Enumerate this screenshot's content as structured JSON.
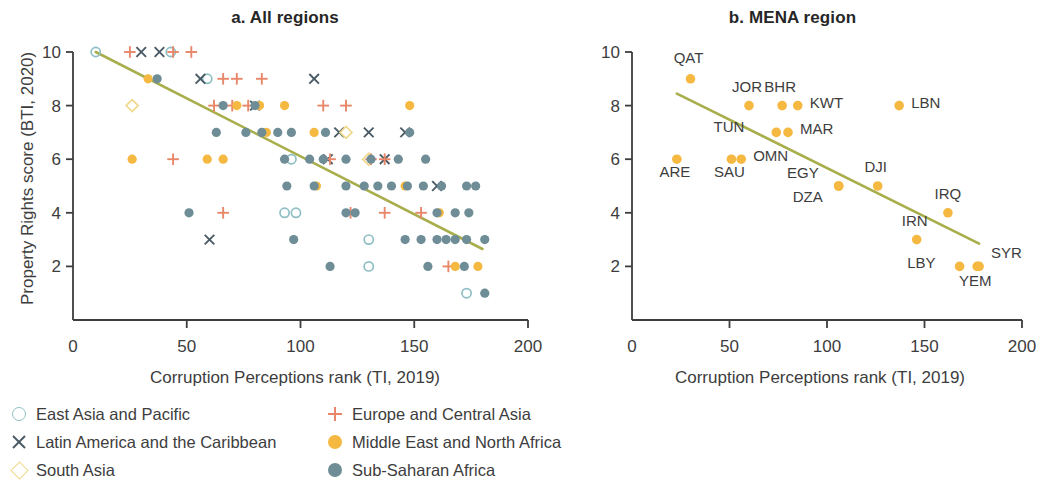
{
  "colors": {
    "mena": "#F5B841",
    "ssa": "#6E8D96",
    "eap": "#8FBFC4",
    "eca": "#E8876A",
    "lac": "#4A5B66",
    "sa": "#F0D98B",
    "trend": "#A8AE4B",
    "axis": "#3d3d3d",
    "text": "#3d3d3d"
  },
  "panel_a": {
    "title": "a. All regions",
    "xlabel": "Corruption Perceptions rank (TI, 2019)",
    "ylabel": "Property Rights score (BTI, 2020)",
    "xticks": [
      "0",
      "50",
      "100",
      "150",
      "200"
    ],
    "yticks": [
      "2",
      "4",
      "6",
      "8",
      "10"
    ]
  },
  "panel_b": {
    "title": "b. MENA region",
    "xlabel": "Corruption Perceptions rank (TI, 2019)",
    "ylabel": "Property Rights score (BTI, 2020)",
    "xticks": [
      "0",
      "50",
      "100",
      "150",
      "200"
    ],
    "yticks": [
      "2",
      "4",
      "6",
      "8",
      "10"
    ]
  },
  "legend": {
    "left": [
      {
        "marker": "open-circle-icon",
        "label": "East Asia and Pacific",
        "color": "#8FBFC4"
      },
      {
        "marker": "cross-x-icon",
        "label": "Latin America and the Caribbean",
        "color": "#4A5B66"
      },
      {
        "marker": "open-diamond-icon",
        "label": "South Asia",
        "color": "#F0D98B"
      }
    ],
    "right": [
      {
        "marker": "plus-icon",
        "label": "Europe and Central Asia",
        "color": "#E8876A"
      },
      {
        "marker": "filled-circle-icon",
        "label": "Middle East and North Africa",
        "color": "#F5B841"
      },
      {
        "marker": "filled-circle-icon",
        "label": "Sub-Saharan Africa",
        "color": "#6E8D96"
      }
    ]
  },
  "chart_data": [
    {
      "type": "scatter",
      "panel": "a",
      "title": "a. All regions",
      "xlabel": "Corruption Perceptions rank (TI, 2019)",
      "ylabel": "Property Rights score (BTI, 2020)",
      "xlim": [
        0,
        200
      ],
      "ylim": [
        0,
        10
      ],
      "xticks": [
        0,
        50,
        100,
        150,
        200
      ],
      "yticks": [
        2,
        4,
        6,
        8,
        10
      ],
      "grid": false,
      "legend_position": "below-figure",
      "trendline": {
        "x": [
          10,
          180
        ],
        "y": [
          10.0,
          2.65
        ],
        "color": "#A8AE4B"
      },
      "series": [
        {
          "name": "East Asia and Pacific",
          "marker": "open-circle",
          "color": "#8FBFC4",
          "points": [
            [
              10,
              10
            ],
            [
              43,
              10
            ],
            [
              59,
              9
            ],
            [
              96,
              6
            ],
            [
              93,
              4
            ],
            [
              98,
              4
            ],
            [
              130,
              3
            ],
            [
              130,
              2
            ],
            [
              173,
              1
            ]
          ]
        },
        {
          "name": "Latin America and the Caribbean",
          "marker": "x",
          "color": "#4A5B66",
          "points": [
            [
              30,
              10
            ],
            [
              38,
              10
            ],
            [
              56,
              9
            ],
            [
              106,
              9
            ],
            [
              80,
              8
            ],
            [
              117,
              7
            ],
            [
              130,
              7
            ],
            [
              146,
              7
            ],
            [
              112,
              6
            ],
            [
              137,
              6
            ],
            [
              160,
              5
            ],
            [
              60,
              3
            ]
          ]
        },
        {
          "name": "South Asia",
          "marker": "open-diamond",
          "color": "#F0D98B",
          "points": [
            [
              26,
              8
            ],
            [
              120,
              7
            ],
            [
              130,
              6
            ]
          ]
        },
        {
          "name": "Europe and Central Asia",
          "marker": "plus",
          "color": "#E8876A",
          "points": [
            [
              25,
              10
            ],
            [
              44,
              10
            ],
            [
              52,
              10
            ],
            [
              66,
              9
            ],
            [
              72,
              9
            ],
            [
              83,
              9
            ],
            [
              62,
              8
            ],
            [
              70,
              8
            ],
            [
              77,
              8
            ],
            [
              110,
              8
            ],
            [
              120,
              8
            ],
            [
              44,
              6
            ],
            [
              113,
              6
            ],
            [
              131,
              6
            ],
            [
              137,
              6
            ],
            [
              66,
              4
            ],
            [
              122,
              4
            ],
            [
              137,
              4
            ],
            [
              153,
              4
            ],
            [
              165,
              2
            ]
          ]
        },
        {
          "name": "Middle East and North Africa",
          "marker": "filled-circle",
          "color": "#F5B841",
          "points": [
            [
              33,
              9
            ],
            [
              26,
              6
            ],
            [
              72,
              8
            ],
            [
              82,
              8
            ],
            [
              93,
              8
            ],
            [
              148,
              8
            ],
            [
              85,
              7
            ],
            [
              106,
              7
            ],
            [
              59,
              6
            ],
            [
              66,
              6
            ],
            [
              107,
              5
            ],
            [
              146,
              5
            ],
            [
              161,
              4
            ],
            [
              168,
              2
            ],
            [
              178,
              2
            ]
          ]
        },
        {
          "name": "Sub-Saharan Africa",
          "marker": "filled-circle",
          "color": "#6E8D96",
          "points": [
            [
              37,
              9
            ],
            [
              66,
              8
            ],
            [
              80,
              8
            ],
            [
              63,
              7
            ],
            [
              76,
              7
            ],
            [
              83,
              7
            ],
            [
              90,
              7
            ],
            [
              96,
              7
            ],
            [
              111,
              7
            ],
            [
              148,
              7
            ],
            [
              93,
              6
            ],
            [
              104,
              6
            ],
            [
              110,
              6
            ],
            [
              120,
              6
            ],
            [
              131,
              6
            ],
            [
              143,
              6
            ],
            [
              155,
              6
            ],
            [
              94,
              5
            ],
            [
              106,
              5
            ],
            [
              120,
              5
            ],
            [
              128,
              5
            ],
            [
              134,
              5
            ],
            [
              140,
              5
            ],
            [
              147,
              5
            ],
            [
              154,
              5
            ],
            [
              162,
              5
            ],
            [
              173,
              5
            ],
            [
              177,
              5
            ],
            [
              51,
              4
            ],
            [
              120,
              4
            ],
            [
              124,
              4
            ],
            [
              160,
              4
            ],
            [
              168,
              4
            ],
            [
              174,
              4
            ],
            [
              97,
              3
            ],
            [
              146,
              3
            ],
            [
              153,
              3
            ],
            [
              160,
              3
            ],
            [
              164,
              3
            ],
            [
              168,
              3
            ],
            [
              173,
              3
            ],
            [
              181,
              3
            ],
            [
              113,
              2
            ],
            [
              156,
              2
            ],
            [
              172,
              2
            ],
            [
              181,
              1
            ]
          ]
        }
      ]
    },
    {
      "type": "scatter",
      "panel": "b",
      "title": "b. MENA region",
      "xlabel": "Corruption Perceptions rank (TI, 2019)",
      "ylabel": "Property Rights score (BTI, 2020)",
      "xlim": [
        0,
        200
      ],
      "ylim": [
        0,
        10
      ],
      "xticks": [
        0,
        50,
        100,
        150,
        200
      ],
      "yticks": [
        2,
        4,
        6,
        8,
        10
      ],
      "grid": false,
      "legend_position": "none",
      "trendline": {
        "x": [
          23,
          178
        ],
        "y": [
          8.45,
          2.85
        ],
        "color": "#A8AE4B"
      },
      "marker_color": "#F5B841",
      "points": [
        {
          "code": "QAT",
          "x": 30,
          "y": 9,
          "label_dx": -2,
          "label_dy": -16
        },
        {
          "code": "ARE",
          "x": 23,
          "y": 6,
          "label_dx": -2,
          "label_dy": 18
        },
        {
          "code": "SAU",
          "x": 51,
          "y": 6,
          "label_dx": -2,
          "label_dy": 18
        },
        {
          "code": "OMN",
          "x": 56,
          "y": 6,
          "label_dx": 12,
          "label_dy": 2
        },
        {
          "code": "JOR",
          "x": 60,
          "y": 8,
          "label_dx": -2,
          "label_dy": -14
        },
        {
          "code": "BHR",
          "x": 77,
          "y": 8,
          "label_dx": -2,
          "label_dy": -14
        },
        {
          "code": "KWT",
          "x": 85,
          "y": 8,
          "label_dx": 12,
          "label_dy": 2
        },
        {
          "code": "LBN",
          "x": 137,
          "y": 8,
          "label_dx": 12,
          "label_dy": 2
        },
        {
          "code": "TUN",
          "x": 74,
          "y": 7,
          "label_dx": -32,
          "label_dy": 0
        },
        {
          "code": "MAR",
          "x": 80,
          "y": 7,
          "label_dx": 12,
          "label_dy": 2
        },
        {
          "code": "EGY",
          "x": 106,
          "y": 5,
          "label_dx": -20,
          "label_dy": -8
        },
        {
          "code": "DZA",
          "x": 106,
          "y": 5,
          "label_dx": -16,
          "label_dy": 16
        },
        {
          "code": "DJI",
          "x": 126,
          "y": 5,
          "label_dx": -2,
          "label_dy": -14
        },
        {
          "code": "IRQ",
          "x": 162,
          "y": 4,
          "label_dx": 0,
          "label_dy": -14
        },
        {
          "code": "IRN",
          "x": 146,
          "y": 3,
          "label_dx": -2,
          "label_dy": -14
        },
        {
          "code": "LBY",
          "x": 168,
          "y": 2,
          "label_dx": -24,
          "label_dy": 2
        },
        {
          "code": "SYR",
          "x": 178,
          "y": 2,
          "label_dx": 12,
          "label_dy": -8
        },
        {
          "code": "YEM",
          "x": 177,
          "y": 2,
          "label_dx": -2,
          "label_dy": 20
        }
      ]
    }
  ]
}
